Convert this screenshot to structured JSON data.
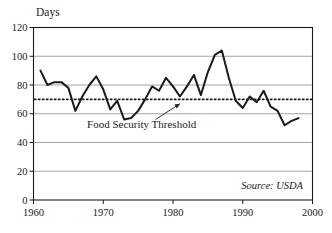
{
  "chart_data": {
    "type": "line",
    "title": "",
    "xlabel": "",
    "ylabel": "Days",
    "xlim": [
      1960,
      2000
    ],
    "ylim": [
      0,
      120
    ],
    "grid": true,
    "grid_axis": "y",
    "legend": "none",
    "x_ticks": [
      1960,
      1970,
      1980,
      1990,
      2000
    ],
    "x_tick_labels": [
      "1960",
      "1970",
      "1980",
      "1990",
      "2000"
    ],
    "y_ticks": [
      0,
      20,
      40,
      60,
      80,
      100,
      120
    ],
    "y_tick_labels": [
      "0",
      "20",
      "40",
      "60",
      "80",
      "100",
      "120"
    ],
    "series": [
      {
        "name": "Days of grain supply",
        "color": "#1a1a1a",
        "x": [
          1961,
          1962,
          1963,
          1964,
          1965,
          1966,
          1967,
          1968,
          1969,
          1970,
          1971,
          1972,
          1973,
          1974,
          1975,
          1976,
          1977,
          1978,
          1979,
          1980,
          1981,
          1982,
          1983,
          1984,
          1985,
          1986,
          1987,
          1988,
          1989,
          1990,
          1991,
          1992,
          1993,
          1994,
          1995,
          1996,
          1997,
          1998
        ],
        "values": [
          90,
          80,
          82,
          82,
          78,
          62,
          72,
          80,
          86,
          77,
          63,
          69,
          56,
          57,
          62,
          70,
          79,
          76,
          85,
          79,
          72,
          79,
          87,
          73,
          89,
          101,
          104,
          85,
          69,
          64,
          72,
          68,
          76,
          65,
          62,
          52,
          55,
          57
        ]
      }
    ],
    "reference_lines": [
      {
        "name": "Food Security Threshold",
        "orientation": "horizontal",
        "value": 70,
        "style": "dotted",
        "color": "#1a1a1a",
        "label": "Food Security Threshold",
        "label_x": 1975.5,
        "label_y": 50,
        "arrow_from_x": 1977.5,
        "arrow_from_y": 56,
        "arrow_to_x": 1981.0,
        "arrow_to_y": 67
      }
    ],
    "annotations": [
      {
        "name": "source-note",
        "text": "Source: USDA",
        "style": "italic",
        "position": "bottom-right-inside"
      }
    ],
    "colors": {
      "line": "#1a1a1a",
      "grid": "#9a9a9a",
      "axis": "#1a1a1a",
      "text": "#1a1a1a",
      "background": "#ffffff"
    }
  },
  "labels": {
    "y_axis_title": "Days",
    "threshold_label": "Food Security Threshold",
    "source": "Source: USDA"
  }
}
